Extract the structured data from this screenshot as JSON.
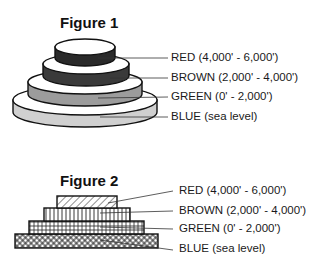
{
  "figure1": {
    "title": "Figure 1",
    "style": "stacked-disks",
    "layers": [
      {
        "key": "red",
        "label": "RED (4,000' - 6,000')",
        "fill": "#2a2a2a"
      },
      {
        "key": "brown",
        "label": "BROWN (2,000' - 4,000')",
        "fill": "#3c3c3c"
      },
      {
        "key": "green",
        "label": "GREEN (0' - 2,000')",
        "fill": "#9a9a9a"
      },
      {
        "key": "blue",
        "label": "BLUE (sea level)",
        "fill": "#cfcfcf"
      }
    ]
  },
  "figure2": {
    "title": "Figure 2",
    "style": "stacked-hatched-bars",
    "layers": [
      {
        "key": "red",
        "label": "RED (4,000' - 6,000')",
        "pattern": "diagonal-hatch"
      },
      {
        "key": "brown",
        "label": "BROWN (2,000' - 4,000')",
        "pattern": "vertical-lines"
      },
      {
        "key": "green",
        "label": "GREEN (0' - 2,000')",
        "pattern": "grid"
      },
      {
        "key": "blue",
        "label": "BLUE (sea level)",
        "pattern": "crosshatch"
      }
    ]
  }
}
